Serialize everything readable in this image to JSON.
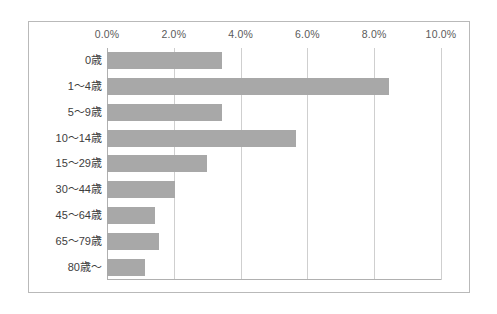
{
  "chart_data": {
    "type": "bar",
    "orientation": "horizontal",
    "title": "",
    "subtitle": "",
    "xlabel": "",
    "ylabel": "",
    "xlim": [
      0,
      10
    ],
    "x_unit": "%",
    "grid": true,
    "legend": false,
    "legend_position": "none",
    "bar_color": "#a8a8a8",
    "axis_color": "#b0b0b0",
    "gridline_color": "#cfcfcf",
    "frame_color": "#b9b9b9",
    "tick_labels": [
      "0.0%",
      "2.0%",
      "4.0%",
      "6.0%",
      "8.0%",
      "10.0%"
    ],
    "tick_values": [
      0,
      2,
      4,
      6,
      8,
      10
    ],
    "categories": [
      "0歳",
      "1〜4歳",
      "5〜9歳",
      "10〜14歳",
      "15〜29歳",
      "30〜44歳",
      "45〜64歳",
      "65〜79歳",
      "80歳〜"
    ],
    "values": [
      3.45,
      8.45,
      3.45,
      5.65,
      3.0,
      2.05,
      1.45,
      1.55,
      1.15
    ],
    "bars": [
      {
        "label": "0歳",
        "value": 3.45
      },
      {
        "label": "1〜4歳",
        "value": 8.45
      },
      {
        "label": "5〜9歳",
        "value": 3.45
      },
      {
        "label": "10〜14歳",
        "value": 5.65
      },
      {
        "label": "15〜29歳",
        "value": 3.0
      },
      {
        "label": "30〜44歳",
        "value": 2.05
      },
      {
        "label": "45〜64歳",
        "value": 1.45
      },
      {
        "label": "65〜79歳",
        "value": 1.55
      },
      {
        "label": "80歳〜",
        "value": 1.15
      }
    ]
  }
}
